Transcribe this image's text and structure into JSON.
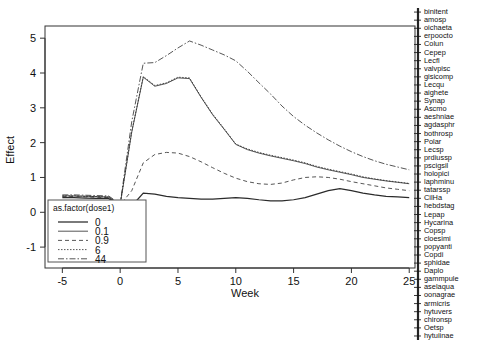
{
  "chart_data": {
    "type": "line",
    "title": "",
    "xlabel": "Week",
    "ylabel": "Effect",
    "xlim": [
      -6.5,
      25.5
    ],
    "ylim": [
      -1.6,
      5.35
    ],
    "grid": false,
    "x_ticks": [
      -5,
      0,
      5,
      10,
      15,
      20,
      25
    ],
    "x_tick_labels": [
      "-5",
      "0",
      "5",
      "10",
      "15",
      "20",
      "25"
    ],
    "y_ticks": [
      -1,
      0,
      1,
      2,
      3,
      4,
      5
    ],
    "y_tick_labels": [
      "-1",
      "0",
      "1",
      "2",
      "3",
      "4",
      "5"
    ],
    "legend": {
      "title": "as.factor(dose1)",
      "position": "bottom-left-inside",
      "entries": [
        {
          "label": "0",
          "dash": "none",
          "width": 1.25
        },
        {
          "label": "0.1",
          "dash": "none",
          "width": 0.8
        },
        {
          "label": "0.9",
          "dash": "4 3",
          "width": 0.8
        },
        {
          "label": "6",
          "dash": "1.5 1.5",
          "width": 0.8
        },
        {
          "label": "44",
          "dash": "6 2 1.5 2",
          "width": 0.8
        }
      ]
    },
    "x": [
      -5,
      -4,
      -3,
      -2,
      -1,
      0,
      1,
      2,
      3,
      4,
      5,
      6,
      7,
      8,
      9,
      10,
      11,
      12,
      13,
      14,
      15,
      16,
      17,
      18,
      19,
      20,
      21,
      22,
      23,
      24,
      25
    ],
    "series": [
      {
        "name": "0",
        "dash": "none",
        "width": 1.25,
        "values": [
          0.42,
          0.42,
          0.41,
          0.4,
          0.4,
          0.18,
          0.18,
          0.55,
          0.52,
          0.46,
          0.42,
          0.4,
          0.38,
          0.38,
          0.4,
          0.42,
          0.4,
          0.36,
          0.33,
          0.33,
          0.36,
          0.42,
          0.52,
          0.62,
          0.68,
          0.62,
          0.55,
          0.5,
          0.46,
          0.44,
          0.42
        ]
      },
      {
        "name": "0.1",
        "dash": "none",
        "width": 0.8,
        "values": [
          0.47,
          0.47,
          0.46,
          0.45,
          0.44,
          0.22,
          2.3,
          3.88,
          3.62,
          3.7,
          3.86,
          3.84,
          3.3,
          2.8,
          2.38,
          1.95,
          1.8,
          1.7,
          1.62,
          1.55,
          1.48,
          1.4,
          1.3,
          1.22,
          1.15,
          1.08,
          1.0,
          0.95,
          0.9,
          0.86,
          0.82
        ]
      },
      {
        "name": "0.9",
        "dash": "4 3",
        "width": 0.8,
        "values": [
          0.45,
          0.45,
          0.44,
          0.43,
          0.42,
          0.21,
          0.62,
          1.42,
          1.66,
          1.72,
          1.7,
          1.6,
          1.45,
          1.28,
          1.12,
          0.98,
          0.88,
          0.82,
          0.8,
          0.84,
          0.93,
          1.0,
          1.02,
          1.0,
          0.95,
          0.88,
          0.82,
          0.76,
          0.7,
          0.66,
          0.62
        ]
      },
      {
        "name": "6",
        "dash": "1.5 1.5",
        "width": 0.8,
        "values": [
          0.47,
          0.47,
          0.46,
          0.45,
          0.44,
          0.22,
          2.32,
          3.9,
          3.64,
          3.72,
          3.88,
          3.86,
          3.32,
          2.82,
          2.4,
          1.96,
          1.82,
          1.72,
          1.64,
          1.57,
          1.5,
          1.42,
          1.32,
          1.24,
          1.17,
          1.1,
          1.02,
          0.96,
          0.91,
          0.87,
          0.83
        ]
      },
      {
        "name": "44",
        "dash": "6 2 1.5 2",
        "width": 0.8,
        "values": [
          0.5,
          0.5,
          0.49,
          0.48,
          0.47,
          0.24,
          2.6,
          4.28,
          4.3,
          4.5,
          4.72,
          4.92,
          4.8,
          4.66,
          4.52,
          4.35,
          4.05,
          3.72,
          3.4,
          3.05,
          2.75,
          2.5,
          2.28,
          2.08,
          1.9,
          1.74,
          1.6,
          1.48,
          1.38,
          1.3,
          1.22
        ]
      }
    ]
  },
  "species_labels": [
    "binitent",
    "amosp",
    "oichaeta",
    "erpoocto",
    "Colun",
    "Cepep",
    "Lecfl",
    "valvpisc",
    "gisicomp",
    "Lecqu",
    "aighete",
    "Synap",
    "Ascmo",
    "aeshniae",
    "agdasphr",
    "bothrosp",
    "Polar",
    "Lecsp",
    "prdiussp",
    "pscigsil",
    "holopici",
    "laphminu",
    "tatarssp",
    "CilHa",
    "hebdstag",
    "Lepap",
    "Hycarina",
    "Copsp",
    "cloesimi",
    "popyanti",
    "Copdi",
    "sphidae",
    "Daplo",
    "gammpule",
    "aselaqua",
    "oonagrae",
    "armicris",
    "hytuvers",
    "chironsp",
    "Oetsp",
    "hytuiinae"
  ]
}
